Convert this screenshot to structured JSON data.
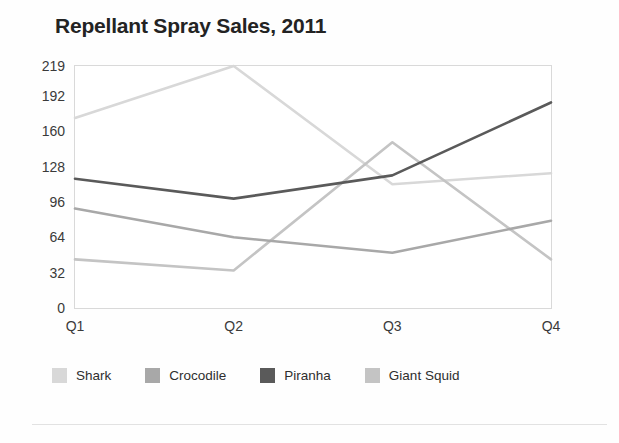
{
  "chart_data": {
    "type": "line",
    "title": "Repellant Spray Sales, 2011",
    "xlabel": "",
    "ylabel": "",
    "categories": [
      "Q1",
      "Q2",
      "Q3",
      "Q4"
    ],
    "yticks": [
      0,
      32,
      64,
      96,
      128,
      160,
      192,
      219
    ],
    "ylim": [
      0,
      219
    ],
    "grid": false,
    "legend_position": "bottom",
    "series": [
      {
        "name": "Shark",
        "color": "#d8d8d8",
        "values": [
          172,
          219,
          112,
          122
        ]
      },
      {
        "name": "Crocodile",
        "color": "#a8a8a8",
        "values": [
          90,
          64,
          50,
          79
        ]
      },
      {
        "name": "Piranha",
        "color": "#5a5a5a",
        "values": [
          117,
          99,
          120,
          186
        ]
      },
      {
        "name": "Giant Squid",
        "color": "#c4c4c4",
        "values": [
          44,
          34,
          150,
          44
        ]
      }
    ]
  },
  "axis": {
    "y_tick_labels": [
      "219",
      "192",
      "160",
      "128",
      "96",
      "64",
      "32",
      "0"
    ],
    "x_tick_labels": [
      "Q1",
      "Q2",
      "Q3",
      "Q4"
    ]
  },
  "legend": {
    "entries": [
      {
        "label": "Shark",
        "color": "#d8d8d8"
      },
      {
        "label": "Crocodile",
        "color": "#a8a8a8"
      },
      {
        "label": "Piranha",
        "color": "#5a5a5a"
      },
      {
        "label": "Giant Squid",
        "color": "#c4c4c4"
      }
    ]
  },
  "style": {
    "plot_border_color": "#d9d9d9",
    "background": "#fefefe",
    "title_color": "#232323"
  }
}
